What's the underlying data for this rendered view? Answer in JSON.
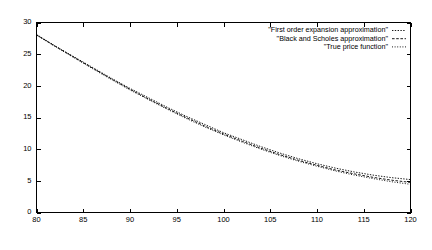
{
  "chart_data": {
    "type": "line",
    "title": "",
    "subtitle": "",
    "xlabel": "",
    "ylabel": "",
    "xlim": [
      80,
      120
    ],
    "ylim": [
      0,
      30
    ],
    "xticks": [
      80,
      85,
      90,
      95,
      100,
      105,
      110,
      115,
      120
    ],
    "yticks": [
      0,
      5,
      10,
      15,
      20,
      25,
      30
    ],
    "xtick_labels": [
      "80",
      "85",
      "90",
      "95",
      "100",
      "105",
      "110",
      "115",
      "120"
    ],
    "ytick_labels": [
      "0",
      "5",
      "10",
      "15",
      "20",
      "25",
      "30"
    ],
    "grid": false,
    "frame": true,
    "tick_direction": "in",
    "legend_position": "top-right-inside",
    "line_color": "#000000",
    "background_color": "#ffffff",
    "x": [
      80,
      82,
      84,
      86,
      88,
      90,
      92,
      94,
      96,
      98,
      100,
      102,
      104,
      106,
      108,
      110,
      112,
      114,
      116,
      118,
      120
    ],
    "series": [
      {
        "name": "\"First order expansion approximation\"",
        "dash": "solid-fine",
        "dasharray": "1.4,1.4",
        "values": [
          28.1,
          26.3,
          24.6,
          22.9,
          21.2,
          19.6,
          18.1,
          16.6,
          15.2,
          13.9,
          12.6,
          11.5,
          10.4,
          9.4,
          8.5,
          7.7,
          7.0,
          6.4,
          5.9,
          5.5,
          5.2
        ]
      },
      {
        "name": "\"Black and Scholes approximation\"",
        "dash": "dashed",
        "dasharray": "2.6,1.6",
        "values": [
          28.05,
          26.25,
          24.5,
          22.8,
          21.1,
          19.45,
          17.9,
          16.4,
          15.0,
          13.65,
          12.4,
          11.25,
          10.15,
          9.15,
          8.25,
          7.45,
          6.7,
          6.1,
          5.55,
          5.1,
          4.75
        ]
      },
      {
        "name": "\"True price function\"",
        "dash": "dotted",
        "dasharray": "1,1.6",
        "values": [
          28.0,
          26.2,
          24.45,
          22.7,
          21.0,
          19.35,
          17.8,
          16.3,
          14.85,
          13.5,
          12.25,
          11.1,
          10.0,
          9.0,
          8.1,
          7.3,
          6.55,
          5.9,
          5.35,
          4.85,
          4.45
        ]
      }
    ]
  },
  "legend": {
    "entries": [
      {
        "label": "\"First order expansion approximation\""
      },
      {
        "label": "\"Black and Scholes approximation\""
      },
      {
        "label": "\"True price function\""
      }
    ]
  }
}
